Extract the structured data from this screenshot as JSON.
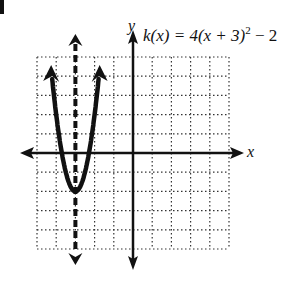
{
  "chart_data": {
    "type": "line",
    "function": "k(x) = 4(x + 3)^2 - 2",
    "xlabel": "x",
    "ylabel": "y",
    "xlim": [
      -5,
      5
    ],
    "ylim": [
      -5,
      5
    ],
    "grid": true,
    "grid_style": "dotted",
    "vertex": [
      -3,
      -2
    ],
    "axis_of_symmetry": {
      "x": -3,
      "style": "dashed"
    },
    "series": [
      {
        "name": "k(x)",
        "x": [
          -4.21,
          -4,
          -3.5,
          -3,
          -2.5,
          -2,
          -1.79
        ],
        "y": [
          3.86,
          2,
          -1,
          -2,
          -1,
          2,
          3.86
        ]
      }
    ]
  },
  "labels": {
    "equation_prefix": "k(x) = 4(x + 3)",
    "equation_exponent": "2",
    "equation_suffix": " − 2",
    "x_axis": "x",
    "y_axis": "y"
  }
}
